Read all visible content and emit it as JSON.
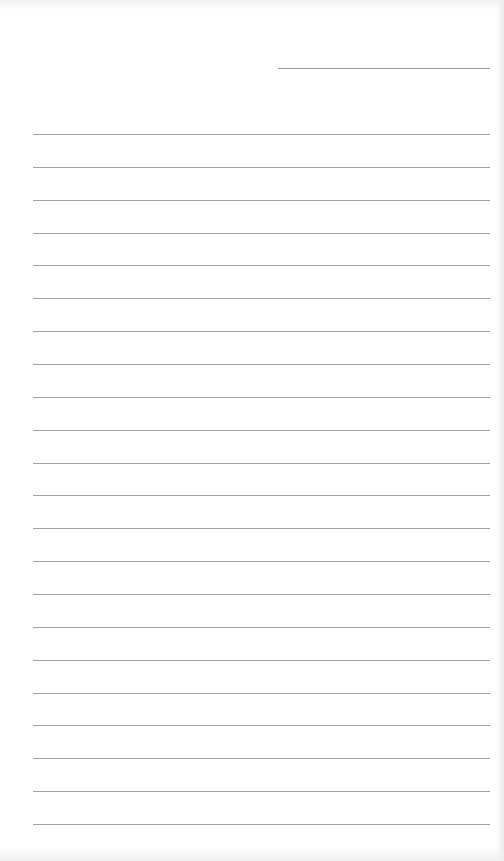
{
  "paper": {
    "type": "lined notepaper",
    "background_color": "#ffffff",
    "line_color": "#a3a3a3",
    "date_line": {
      "present": true,
      "text": ""
    },
    "ruled_line_count": 22,
    "ruled_lines_text": [
      "",
      "",
      "",
      "",
      "",
      "",
      "",
      "",
      "",
      "",
      "",
      "",
      "",
      "",
      "",
      "",
      "",
      "",
      "",
      "",
      "",
      ""
    ]
  }
}
